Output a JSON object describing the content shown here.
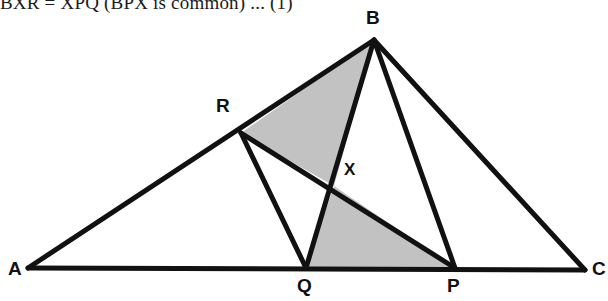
{
  "page": {
    "width": 608,
    "height": 301,
    "background": "#ffffff"
  },
  "proof_text": {
    "line": "BXR = XPQ (BPX is common) ... (1)"
  },
  "figure": {
    "stroke_color": "#111111",
    "shade_color": "#c2c2c2",
    "stroke_width": 5,
    "points": {
      "A": {
        "label": "A",
        "x": 28,
        "y": 268,
        "label_x": 8,
        "label_y": 259
      },
      "B": {
        "label": "B",
        "x": 374,
        "y": 40,
        "label_x": 366,
        "label_y": 8
      },
      "C": {
        "label": "C",
        "x": 585,
        "y": 270,
        "label_x": 592,
        "label_y": 259
      },
      "R": {
        "label": "R",
        "x": 241,
        "y": 133,
        "label_x": 216,
        "label_y": 96
      },
      "Q": {
        "label": "Q",
        "x": 306,
        "y": 268,
        "label_x": 297,
        "label_y": 276
      },
      "P": {
        "label": "P",
        "x": 455,
        "y": 268,
        "label_x": 447,
        "label_y": 276
      },
      "X": {
        "label": "X",
        "x": 334,
        "y": 186,
        "label_x": 344,
        "label_y": 160
      }
    },
    "segments": [
      {
        "name": "segment-AB",
        "from": "A",
        "to": "B"
      },
      {
        "name": "segment-AC",
        "from": "A",
        "to": "C"
      },
      {
        "name": "segment-BC",
        "from": "B",
        "to": "C"
      },
      {
        "name": "segment-BQ",
        "from": "B",
        "to": "Q"
      },
      {
        "name": "segment-BP",
        "from": "B",
        "to": "P"
      },
      {
        "name": "segment-RQ",
        "from": "R",
        "to": "Q"
      },
      {
        "name": "segment-RP",
        "from": "R",
        "to": "P"
      }
    ],
    "shaded_regions": [
      {
        "name": "shaded-triangle-BRX",
        "vertices": [
          "B",
          "R",
          "X"
        ]
      },
      {
        "name": "shaded-triangle-XQP",
        "vertices": [
          "X",
          "Q",
          "P"
        ]
      }
    ]
  }
}
